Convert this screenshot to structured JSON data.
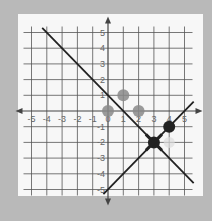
{
  "chart_data": {
    "type": "scatter",
    "title": "",
    "xlabel": "",
    "ylabel": "",
    "xlim": [
      -5,
      5
    ],
    "ylim": [
      -5,
      5
    ],
    "grid": true,
    "x_ticks": [
      -5,
      -4,
      -3,
      -2,
      -1,
      0,
      1,
      2,
      3,
      4,
      5
    ],
    "y_ticks": [
      5,
      4,
      3,
      2,
      1,
      -1,
      -2,
      -3,
      -4,
      -5
    ],
    "x_tick_labels": [
      "-5",
      "-4",
      "-3",
      "-2",
      "-1",
      "0",
      "1",
      "2",
      "3",
      "4",
      "5"
    ],
    "y_tick_labels": [
      "5",
      "4",
      "3",
      "2",
      "1",
      "-1",
      "-2",
      "-3",
      "-4",
      "-5"
    ],
    "lines": [
      {
        "name": "descending-line",
        "equation": "y = -x + 1",
        "from": [
          -4.3,
          5.3
        ],
        "to": [
          5.6,
          -4.6
        ],
        "color": "#222222"
      },
      {
        "name": "ascending-line",
        "equation": "y = x - 5",
        "from": [
          -0.3,
          -5.3
        ],
        "to": [
          5.6,
          0.6
        ],
        "color": "#222222"
      }
    ],
    "points": [
      {
        "x": 0,
        "y": 0,
        "style": "gray",
        "color": "#8a8a8a"
      },
      {
        "x": 1,
        "y": 1,
        "style": "gray",
        "color": "#8a8a8a"
      },
      {
        "x": 2,
        "y": 0,
        "style": "gray",
        "color": "#8a8a8a"
      },
      {
        "x": 4,
        "y": -1,
        "style": "black",
        "color": "#222222"
      },
      {
        "x": 3,
        "y": -2,
        "style": "intersection",
        "color": "#222222"
      },
      {
        "x": 4,
        "y": -2,
        "style": "faint",
        "color": "#dddddd"
      }
    ]
  }
}
